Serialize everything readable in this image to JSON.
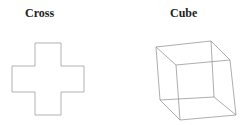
{
  "figures": [
    {
      "label": "Cross",
      "shape": "cross-outline"
    },
    {
      "label": "Cube",
      "shape": "wireframe-cube"
    }
  ],
  "colors": {
    "stroke": "#9a9a9a",
    "text": "#222222"
  }
}
